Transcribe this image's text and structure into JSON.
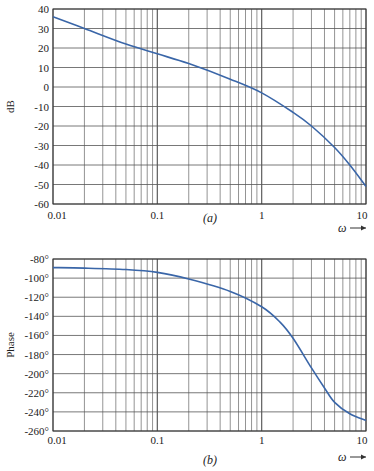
{
  "chart_data": [
    {
      "type": "line",
      "title": "",
      "caption": "(a)",
      "xlabel": "ω",
      "ylabel": "dB",
      "xscale": "log",
      "xlim": [
        0.01,
        10
      ],
      "ylim": [
        -60,
        40
      ],
      "grid": true,
      "x_tick_labels": [
        "0.01",
        "0.1",
        "1",
        "10"
      ],
      "y_ticks": [
        40,
        30,
        20,
        10,
        0,
        -10,
        -20,
        -30,
        -40,
        -50,
        -60
      ],
      "y_tick_labels": [
        "40",
        "30",
        "20",
        "10",
        "0",
        "-10",
        "-20",
        "-30",
        "-40",
        "-50",
        "-60"
      ],
      "series": [
        {
          "name": "magnitude",
          "color": "#3a66a8",
          "x": [
            0.01,
            0.02,
            0.05,
            0.1,
            0.2,
            0.5,
            1,
            2,
            3,
            5,
            7,
            10
          ],
          "values": [
            36,
            30,
            22,
            17,
            12,
            4,
            -3,
            -13,
            -20,
            -31,
            -40,
            -51
          ]
        }
      ]
    },
    {
      "type": "line",
      "title": "",
      "caption": "(b)",
      "xlabel": "ω",
      "ylabel": "Phase",
      "xscale": "log",
      "xlim": [
        0.01,
        10
      ],
      "ylim": [
        -260,
        -80
      ],
      "grid": true,
      "x_tick_labels": [
        "0.01",
        "0.1",
        "1",
        "10"
      ],
      "y_ticks": [
        -80,
        -100,
        -120,
        -140,
        -160,
        -180,
        -200,
        -220,
        -240,
        -260
      ],
      "y_tick_labels": [
        "-80°",
        "-100°",
        "-120°",
        "-140°",
        "-160°",
        "-180°",
        "-200°",
        "-220°",
        "-240°",
        "-260°"
      ],
      "series": [
        {
          "name": "phase",
          "color": "#3a66a8",
          "x": [
            0.01,
            0.02,
            0.05,
            0.1,
            0.2,
            0.5,
            1,
            1.5,
            2,
            3,
            4,
            5,
            7,
            10
          ],
          "values": [
            -89,
            -89.5,
            -91,
            -94,
            -101,
            -114,
            -130,
            -146,
            -163,
            -194,
            -215,
            -230,
            -242,
            -249
          ]
        }
      ]
    }
  ]
}
